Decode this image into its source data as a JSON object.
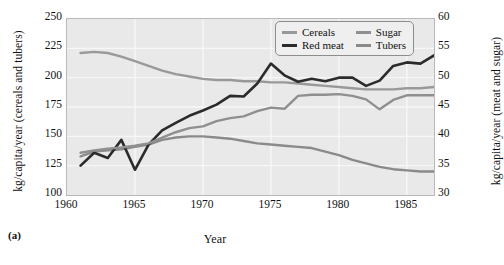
{
  "figure": {
    "panel_tag": "(a)",
    "xlabel": "Year",
    "ylabel_left": "kg/capita/year (cereals and tubers)",
    "ylabel_right": "kg/capita/year (meat and sugar)"
  },
  "legend": {
    "items": [
      {
        "label": "Cereals",
        "color": "#999999"
      },
      {
        "label": "Sugar",
        "color": "#8f8f8f"
      },
      {
        "label": "Red meat",
        "color": "#2b2b2b"
      },
      {
        "label": "Tubers",
        "color": "#8a8a8a"
      }
    ]
  },
  "axes": {
    "x_ticks": [
      "1960",
      "1965",
      "1970",
      "1975",
      "1980",
      "1985"
    ],
    "y_ticks_left": [
      "250",
      "225",
      "200",
      "175",
      "150",
      "125",
      "100"
    ],
    "y_ticks_right": [
      "60",
      "55",
      "50",
      "45",
      "40",
      "35",
      "30"
    ]
  },
  "chart_data": {
    "type": "line",
    "title": "",
    "xlabel": "Year",
    "ylabel": "kg/capita/year (cereals and tubers)",
    "ylabel_secondary": "kg/capita/year (meat and sugar)",
    "xlim": [
      1960,
      1987
    ],
    "ylim": [
      100,
      250
    ],
    "ylim_secondary": [
      30,
      60
    ],
    "grid": true,
    "legend_position": "top-right",
    "x": [
      1961,
      1962,
      1963,
      1964,
      1965,
      1966,
      1967,
      1968,
      1969,
      1970,
      1971,
      1972,
      1973,
      1974,
      1975,
      1976,
      1977,
      1978,
      1979,
      1980,
      1981,
      1982,
      1983,
      1984,
      1985,
      1986,
      1987
    ],
    "series": [
      {
        "name": "Cereals",
        "axis": "left",
        "unit": "kg/capita/year",
        "color": "#999999",
        "values": [
          221,
          222,
          221,
          218,
          214,
          210,
          206,
          203,
          201,
          199,
          198,
          198,
          197,
          197,
          196,
          196,
          195,
          194,
          193,
          192,
          191,
          190,
          190,
          190,
          191,
          191,
          192
        ]
      },
      {
        "name": "Tubers",
        "axis": "left",
        "unit": "kg/capita/year",
        "color": "#8a8a8a",
        "values": [
          133,
          137,
          138,
          139,
          141,
          143,
          147,
          149,
          150,
          150,
          149,
          148,
          146,
          144,
          143,
          142,
          141,
          140,
          137,
          134,
          130,
          127,
          124,
          122,
          121,
          120,
          120
        ]
      },
      {
        "name": "Red meat",
        "axis": "right",
        "unit": "kg/capita/year",
        "color": "#2b2b2b",
        "values": [
          35.0,
          37.2,
          36.3,
          39.4,
          34.3,
          38.6,
          41.0,
          42.3,
          43.5,
          44.4,
          45.4,
          46.9,
          46.8,
          49.0,
          52.4,
          50.4,
          49.3,
          49.8,
          49.4,
          50.0,
          50.0,
          48.6,
          49.5,
          52.0,
          52.6,
          52.4,
          53.8
        ]
      },
      {
        "name": "Sugar",
        "axis": "right",
        "unit": "kg/capita/year",
        "color": "#8f8f8f",
        "values": [
          37.2,
          37.6,
          37.9,
          38.1,
          38.4,
          38.8,
          39.8,
          40.7,
          41.4,
          41.7,
          42.6,
          43.1,
          43.4,
          44.3,
          44.9,
          44.7,
          46.9,
          47.1,
          47.1,
          47.2,
          46.9,
          46.3,
          44.6,
          46.2,
          47.0,
          47.0,
          47.0
        ]
      }
    ]
  }
}
